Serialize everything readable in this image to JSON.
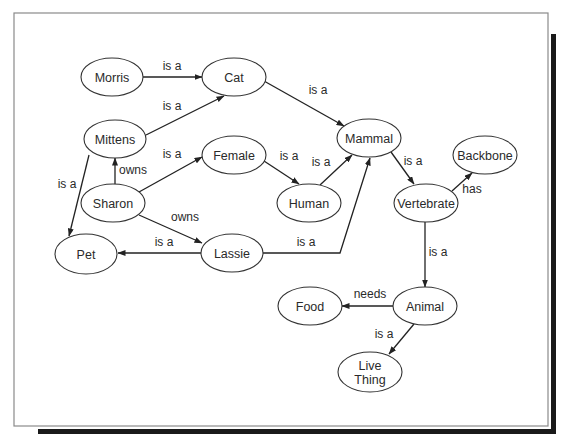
{
  "diagram": {
    "type": "semantic-network",
    "frame": {
      "x": 14,
      "y": 13,
      "width": 534,
      "height": 413,
      "border_color": "#8a8a8a",
      "shadow_color": "#1a1a1a"
    },
    "style": {
      "node_stroke": "#333333",
      "edge_stroke": "#222222",
      "text_color": "#2a2a2a",
      "background": "#ffffff"
    },
    "nodes": [
      {
        "id": "morris",
        "label": [
          "Morris"
        ],
        "cx": 112,
        "cy": 77,
        "rx": 31,
        "ry": 19
      },
      {
        "id": "cat",
        "label": [
          "Cat"
        ],
        "cx": 234,
        "cy": 77,
        "rx": 32,
        "ry": 19
      },
      {
        "id": "mittens",
        "label": [
          "Mittens"
        ],
        "cx": 115,
        "cy": 139,
        "rx": 31,
        "ry": 19
      },
      {
        "id": "female",
        "label": [
          "Female"
        ],
        "cx": 234,
        "cy": 155,
        "rx": 32,
        "ry": 19
      },
      {
        "id": "mammal",
        "label": [
          "Mammal"
        ],
        "cx": 369,
        "cy": 138,
        "rx": 32,
        "ry": 19
      },
      {
        "id": "backbone",
        "label": [
          "Backbone"
        ],
        "cx": 485,
        "cy": 155,
        "rx": 32,
        "ry": 19
      },
      {
        "id": "sharon",
        "label": [
          "Sharon"
        ],
        "cx": 113,
        "cy": 203,
        "rx": 32,
        "ry": 19
      },
      {
        "id": "human",
        "label": [
          "Human"
        ],
        "cx": 309,
        "cy": 203,
        "rx": 32,
        "ry": 19
      },
      {
        "id": "vertebrate",
        "label": [
          "Vertebrate"
        ],
        "cx": 426,
        "cy": 203,
        "rx": 32,
        "ry": 19
      },
      {
        "id": "pet",
        "label": [
          "Pet"
        ],
        "cx": 86,
        "cy": 254,
        "rx": 31,
        "ry": 20
      },
      {
        "id": "lassie",
        "label": [
          "Lassie"
        ],
        "cx": 232,
        "cy": 253,
        "rx": 31,
        "ry": 19
      },
      {
        "id": "food",
        "label": [
          "Food"
        ],
        "cx": 310,
        "cy": 306,
        "rx": 32,
        "ry": 19
      },
      {
        "id": "animal",
        "label": [
          "Animal"
        ],
        "cx": 425,
        "cy": 306,
        "rx": 32,
        "ry": 19
      },
      {
        "id": "live-thing",
        "label": [
          "Live",
          "Thing"
        ],
        "cx": 370,
        "cy": 372,
        "rx": 32,
        "ry": 20
      }
    ],
    "edges": [
      {
        "from": "morris",
        "to": "cat",
        "label": "is a",
        "points": [
          [
            143,
            77
          ],
          [
            202,
            77
          ]
        ],
        "label_pos": [
          172,
          70
        ]
      },
      {
        "from": "mittens",
        "to": "cat",
        "label": "is a",
        "points": [
          [
            146,
            135
          ],
          [
            224,
            96
          ]
        ],
        "label_pos": [
          172,
          110
        ]
      },
      {
        "from": "cat",
        "to": "mammal",
        "label": "is a",
        "points": [
          [
            264,
            81
          ],
          [
            344,
            126
          ]
        ],
        "label_pos": [
          318,
          94
        ]
      },
      {
        "from": "sharon",
        "to": "mittens",
        "label": "owns",
        "points": [
          [
            115,
            184
          ],
          [
            115,
            158
          ]
        ],
        "label_pos": [
          133,
          174
        ]
      },
      {
        "from": "sharon",
        "to": "female",
        "label": "is a",
        "points": [
          [
            139,
            192
          ],
          [
            202,
            157
          ]
        ],
        "label_pos": [
          172,
          158
        ]
      },
      {
        "from": "female",
        "to": "human",
        "label": "is a",
        "points": [
          [
            264,
            161
          ],
          [
            299,
            184
          ]
        ],
        "label_pos": [
          289,
          160
        ]
      },
      {
        "from": "human",
        "to": "mammal",
        "label": "is a",
        "points": [
          [
            320,
            185
          ],
          [
            352,
            155
          ]
        ],
        "label_pos": [
          321,
          166
        ]
      },
      {
        "from": "mittens",
        "to": "pet",
        "label": "is a",
        "points": [
          [
            89,
            155
          ],
          [
            69,
            236
          ]
        ],
        "label_pos": [
          67,
          188
        ]
      },
      {
        "from": "sharon",
        "to": "lassie",
        "label": "owns",
        "points": [
          [
            139,
            215
          ],
          [
            202,
            243
          ]
        ],
        "label_pos": [
          185,
          221
        ]
      },
      {
        "from": "lassie",
        "to": "pet",
        "label": "is a",
        "points": [
          [
            201,
            253
          ],
          [
            118,
            253
          ]
        ],
        "label_pos": [
          164,
          246
        ]
      },
      {
        "from": "lassie",
        "to": "mammal",
        "label": "is a",
        "points": [
          [
            263,
            253
          ],
          [
            340,
            253
          ],
          [
            370,
            158
          ]
        ],
        "label_pos": [
          306,
          246
        ]
      },
      {
        "from": "mammal",
        "to": "vertebrate",
        "label": "is a",
        "points": [
          [
            391,
            152
          ],
          [
            414,
            184
          ]
        ],
        "label_pos": [
          413,
          165
        ]
      },
      {
        "from": "vertebrate",
        "to": "backbone",
        "label": "has",
        "points": [
          [
            452,
            191
          ],
          [
            472,
            173
          ]
        ],
        "label_pos": [
          472,
          193
        ]
      },
      {
        "from": "vertebrate",
        "to": "animal",
        "label": "is a",
        "points": [
          [
            425,
            222
          ],
          [
            425,
            287
          ]
        ],
        "label_pos": [
          438,
          256
        ]
      },
      {
        "from": "animal",
        "to": "food",
        "label": "needs",
        "points": [
          [
            393,
            306
          ],
          [
            342,
            306
          ]
        ],
        "label_pos": [
          370,
          298
        ]
      },
      {
        "from": "animal",
        "to": "live-thing",
        "label": "is a",
        "points": [
          [
            414,
            324
          ],
          [
            389,
            354
          ]
        ],
        "label_pos": [
          384,
          338
        ]
      }
    ]
  }
}
